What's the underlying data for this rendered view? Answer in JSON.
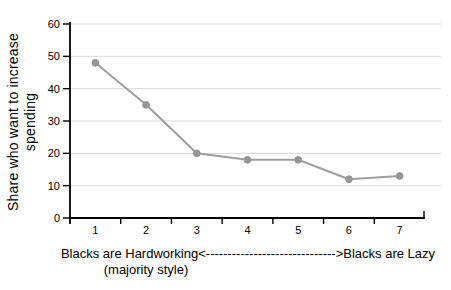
{
  "chart_data": {
    "type": "line",
    "x": [
      1,
      2,
      3,
      4,
      5,
      6,
      7
    ],
    "series": [
      {
        "name": "Share who want to increase spending",
        "values": [
          48,
          35,
          20,
          18,
          18,
          12,
          13
        ]
      }
    ],
    "title": "",
    "ylabel": "Share who want to increase spending",
    "ylabel_lines": [
      "Share who want to increase",
      "spending"
    ],
    "xlabel_left": "Blacks are Hardworking",
    "xlabel_arrow": "<------------------------------>",
    "xlabel_right": "Blacks are Lazy",
    "xlabel_sub": "(majority style)",
    "y_ticks": [
      0,
      10,
      20,
      30,
      40,
      50,
      60
    ],
    "x_ticks": [
      1,
      2,
      3,
      4,
      5,
      6,
      7
    ],
    "ylim": [
      0,
      60
    ],
    "grid": "horizontal",
    "legend": "none",
    "colors": {
      "line": "#9e9e9e",
      "marker": "#969696",
      "gridline": "#d9d9d9",
      "axis": "#000000",
      "text": "#000000",
      "background": "#ffffff"
    }
  }
}
